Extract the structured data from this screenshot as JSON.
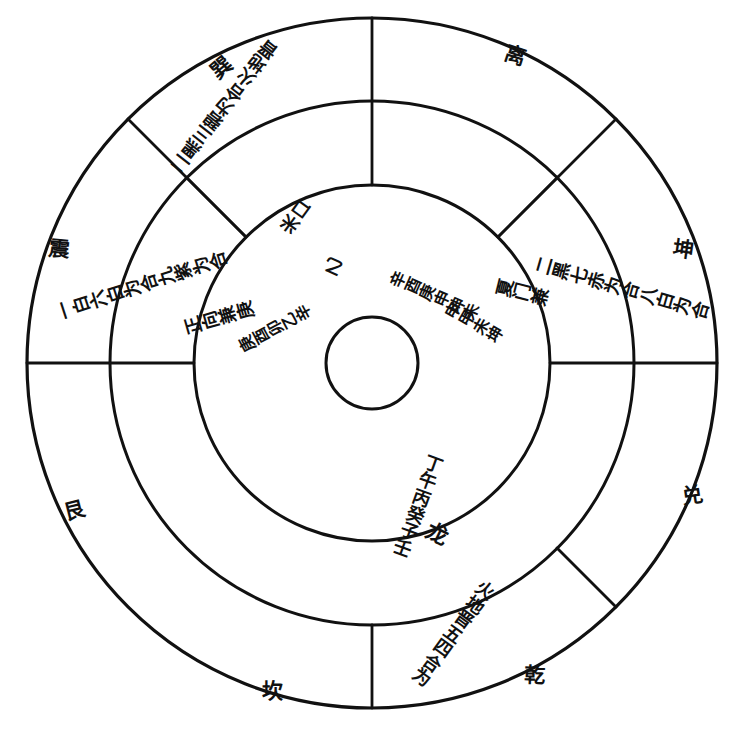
{
  "diagram": {
    "type": "feng-shui-compass",
    "background": "#ffffff",
    "stroke_color": "#111111",
    "center": {
      "x": 372,
      "y": 363
    },
    "rings": [
      {
        "name": "outer-circle",
        "radius": 345
      },
      {
        "name": "middle-circle",
        "radius": 262
      },
      {
        "name": "inner-circle",
        "radius": 178
      },
      {
        "name": "hub-circle",
        "radius": 46
      }
    ]
  },
  "trigrams": [
    {
      "name": "xun",
      "label": "巽",
      "angle_deg": 225,
      "x": 214,
      "y": 70
    },
    {
      "name": "li",
      "label": "离",
      "angle_deg": 270,
      "x": 508,
      "y": 58
    },
    {
      "name": "kun",
      "label": "坤",
      "angle_deg": 315,
      "x": 676,
      "y": 252
    },
    {
      "name": "dui",
      "label": "兑",
      "angle_deg": 0,
      "x": 686,
      "y": 498
    },
    {
      "name": "qian",
      "label": "乾",
      "angle_deg": 45,
      "x": 528,
      "y": 677
    },
    {
      "name": "kan",
      "label": "坎",
      "angle_deg": 90,
      "x": 265,
      "y": 693
    },
    {
      "name": "gen",
      "label": "艮",
      "angle_deg": 135,
      "x": 68,
      "y": 513
    },
    {
      "name": "zhen",
      "label": "震",
      "angle_deg": 180,
      "x": 52,
      "y": 251
    }
  ],
  "outer_ring_sectors": [
    {
      "name": "outer-top-left",
      "text": "二黑三碧为合火地晋",
      "lines": [
        "二黑",
        "三碧",
        "为合"
      ],
      "rotated": true,
      "x": 212,
      "y": 126,
      "rot": -42
    },
    {
      "name": "outer-left",
      "text": "一白六白为合九紫为合",
      "lines": [
        "一白",
        "六白",
        "为合",
        "九紫",
        "为合"
      ],
      "rotated": true,
      "x": 126,
      "y": 292,
      "rot": -78
    },
    {
      "name": "outer-right",
      "text": "二黑七赤为合八白为合",
      "lines": [
        "二黑",
        "七赤",
        "为合",
        "八白",
        "为合"
      ],
      "rotated": true,
      "x": 604,
      "y": 282,
      "rot": 100
    },
    {
      "name": "outer-bottom-right",
      "text": "火地晋五四合为",
      "lines": [
        "五四",
        "火地晋",
        "合为"
      ],
      "rotated": false,
      "x": 470,
      "y": 614,
      "rot": 34
    }
  ],
  "middle_ring_sectors": [
    {
      "name": "middle-top-left",
      "text": "米口",
      "lines": [
        "米口"
      ],
      "rotated": true,
      "x": 300,
      "y": 214,
      "rot": -46
    },
    {
      "name": "middle-left",
      "text": "正向兼庚",
      "lines": [
        "庚",
        "兼",
        "向",
        "正"
      ],
      "rotated": true,
      "x": 222,
      "y": 318,
      "rot": -74
    },
    {
      "name": "middle-right",
      "text": "夏门兼",
      "lines": [
        "夏",
        "门",
        "兼"
      ],
      "rotated": true,
      "x": 524,
      "y": 296,
      "rot": 96
    },
    {
      "name": "middle-bottom",
      "text": "龙",
      "lines": [
        "龙"
      ],
      "rotated": false,
      "x": 437,
      "y": 538,
      "rot": 26
    }
  ],
  "inner_ring_sectors": [
    {
      "name": "inner-top-left",
      "text": "乙",
      "lines": [
        "乙"
      ],
      "rotated": true,
      "x": 336,
      "y": 268,
      "rot": -34
    },
    {
      "name": "inner-left",
      "text": "庚酉卯乙辛",
      "lines": [
        "辛",
        "乙",
        "卯",
        "酉",
        "庚"
      ],
      "rotated": true,
      "x": 290,
      "y": 322,
      "rot": -62
    },
    {
      "name": "inner-right-outer",
      "text": "辛酉庚申坤未",
      "lines": [
        "辛酉庚",
        "申坤未"
      ],
      "rotated": true,
      "x": 424,
      "y": 292,
      "rot": 112
    },
    {
      "name": "inner-right-inner",
      "text": "申甲未坤",
      "lines": [
        "申甲",
        "未坤"
      ],
      "rotated": true,
      "x": 470,
      "y": 322,
      "rot": 118
    },
    {
      "name": "inner-bottom",
      "text": "丁午丙癸子壬",
      "lines": [
        "丁午丙",
        "癸子壬"
      ],
      "rotated": false,
      "x": 438,
      "y": 486,
      "rot": 18
    }
  ],
  "radial_dividers": [
    {
      "name": "divider-top",
      "angle_deg": 270
    },
    {
      "name": "divider-left",
      "angle_deg": 180
    },
    {
      "name": "divider-right",
      "angle_deg": 0
    },
    {
      "name": "divider-nw",
      "angle_deg": 225
    },
    {
      "name": "divider-ne",
      "angle_deg": 315
    },
    {
      "name": "divider-sw",
      "angle_deg": 135
    },
    {
      "name": "divider-se",
      "angle_deg": 45
    },
    {
      "name": "divider-bottom",
      "angle_deg": 90
    }
  ]
}
